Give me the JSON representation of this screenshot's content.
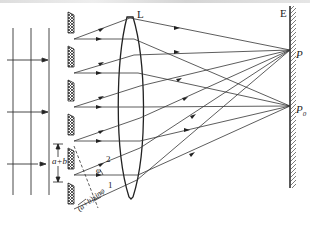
{
  "figure": {
    "labels": {
      "lens": "L",
      "screen": "E",
      "point_p": "P",
      "point_p0": "P",
      "point_p0_sub": "0",
      "grating_constant": "a+b",
      "path_difference": "(a+b)sinφ",
      "ray_1": "1",
      "ray_2": "2",
      "angle": "φ"
    },
    "colors": {
      "line": "#333333",
      "hatch": "#444444",
      "background": "#ffffff"
    },
    "slits": [
      {
        "y_top": 12,
        "y_bottom": 33
      },
      {
        "y_top": 46,
        "y_bottom": 67
      },
      {
        "y_top": 80,
        "y_bottom": 101
      },
      {
        "y_top": 114,
        "y_bottom": 135
      },
      {
        "y_top": 148,
        "y_bottom": 169
      },
      {
        "y_top": 182,
        "y_bottom": 203
      }
    ]
  }
}
